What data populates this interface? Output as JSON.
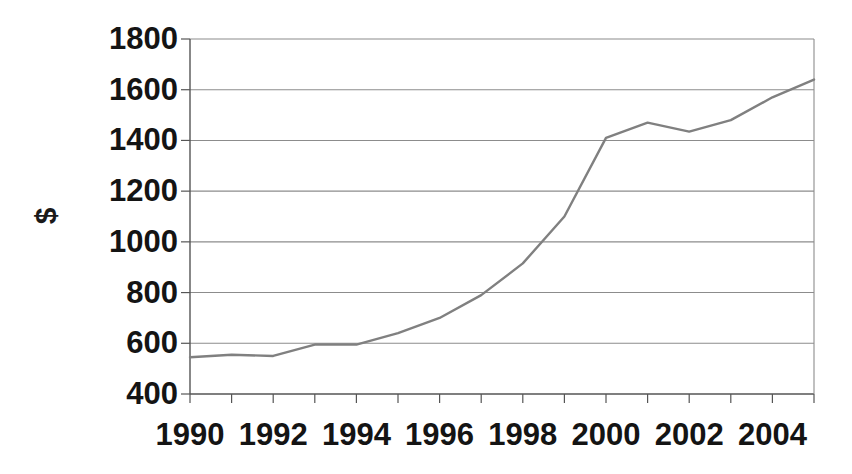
{
  "chart_data": {
    "type": "line",
    "title": "",
    "subtitle": "",
    "xlabel": "",
    "ylabel": "$",
    "x": [
      1990,
      1991,
      1992,
      1993,
      1994,
      1995,
      1996,
      1997,
      1998,
      1999,
      2000,
      2001,
      2002,
      2003,
      2004,
      2005
    ],
    "values": [
      545,
      555,
      550,
      595,
      595,
      640,
      700,
      790,
      915,
      1100,
      1410,
      1470,
      1435,
      1480,
      1570,
      1640
    ],
    "series": [
      {
        "name": "$",
        "values": [
          545,
          555,
          550,
          595,
          595,
          640,
          700,
          790,
          915,
          1100,
          1410,
          1470,
          1435,
          1480,
          1570,
          1640
        ]
      }
    ],
    "xlim": [
      1990,
      2005
    ],
    "ylim": [
      400,
      1800
    ],
    "x_tick_labels": [
      "1990",
      "1992",
      "1994",
      "1996",
      "1998",
      "2000",
      "2002",
      "2004"
    ],
    "x_tick_values": [
      1990,
      1992,
      1994,
      1996,
      1998,
      2000,
      2002,
      2004
    ],
    "x_minor_ticks": [
      1990,
      1991,
      1992,
      1993,
      1994,
      1995,
      1996,
      1997,
      1998,
      1999,
      2000,
      2001,
      2002,
      2003,
      2004,
      2005
    ],
    "y_tick_labels": [
      "400",
      "600",
      "800",
      "1000",
      "1200",
      "1400",
      "1600",
      "1800"
    ],
    "y_tick_values": [
      400,
      600,
      800,
      1000,
      1200,
      1400,
      1600,
      1800
    ],
    "grid": "horizontal",
    "legend": "none",
    "line_color": "#808080",
    "axis_color": "#555555",
    "grid_color": "#8c8c8c",
    "text_color": "#141414",
    "background": "#ffffff"
  }
}
